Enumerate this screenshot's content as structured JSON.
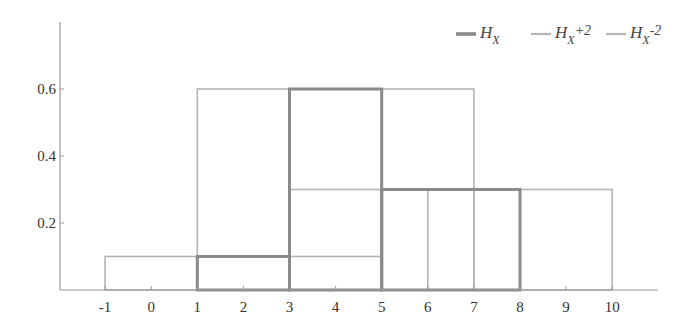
{
  "chart_data": {
    "type": "bar",
    "title": "",
    "xlabel": "",
    "ylabel": "",
    "xlim": [
      -2,
      11
    ],
    "ylim": [
      0,
      0.8
    ],
    "grid": false,
    "legend_position": "top-right",
    "x_ticks": [
      "-1",
      "0",
      "1",
      "2",
      "3",
      "4",
      "5",
      "6",
      "7",
      "8",
      "9",
      "10"
    ],
    "y_ticks": [
      "0.2",
      "0.4",
      "0.6"
    ],
    "series": [
      {
        "name": "H_X",
        "legend_main": "H",
        "legend_sub": "X",
        "legend_suffix": "",
        "color": "#8a8a8a",
        "line_width": 3,
        "bars": [
          {
            "x0": 1,
            "x1": 3,
            "height": 0.1
          },
          {
            "x0": 3,
            "x1": 5,
            "height": 0.6
          },
          {
            "x0": 5,
            "x1": 8,
            "height": 0.3
          }
        ]
      },
      {
        "name": "H_X+2",
        "legend_main": "H",
        "legend_sub": "X",
        "legend_suffix": "+2",
        "color": "#b4b4b4",
        "line_width": 1.6,
        "bars": [
          {
            "x0": 3,
            "x1": 5,
            "height": 0.1
          },
          {
            "x0": 5,
            "x1": 7,
            "height": 0.6
          },
          {
            "x0": 7,
            "x1": 10,
            "height": 0.3
          }
        ]
      },
      {
        "name": "H_X-2",
        "legend_main": "H",
        "legend_sub": "X",
        "legend_suffix": "-2",
        "color": "#b4b4b4",
        "line_width": 1.6,
        "bars": [
          {
            "x0": -1,
            "x1": 1,
            "height": 0.1
          },
          {
            "x0": 1,
            "x1": 3,
            "height": 0.6
          },
          {
            "x0": 3,
            "x1": 6,
            "height": 0.3
          }
        ]
      }
    ]
  }
}
